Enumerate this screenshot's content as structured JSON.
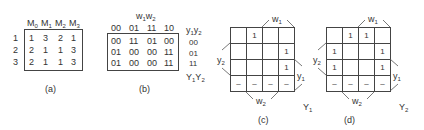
{
  "panel_a": {
    "caption": "(a)",
    "columns": [
      "M0",
      "M1",
      "M2",
      "M3"
    ],
    "rows": [
      {
        "label": "1",
        "values": [
          "1",
          "3",
          "2",
          "1"
        ]
      },
      {
        "label": "2",
        "values": [
          "2",
          "1",
          "1",
          "3"
        ]
      },
      {
        "label": "3",
        "values": [
          "2",
          "1",
          "1",
          "3"
        ]
      }
    ]
  },
  "panel_b": {
    "caption": "(b)",
    "input_label": "w1w2",
    "columns": [
      "00",
      "01",
      "11",
      "10"
    ],
    "state_label": "y1y2",
    "next_state_label": "Y1Y2",
    "rows": [
      {
        "state": "00",
        "values": [
          "00",
          "11",
          "01",
          "00"
        ]
      },
      {
        "state": "01",
        "values": [
          "01",
          "00",
          "00",
          "11"
        ]
      },
      {
        "state": "11",
        "values": [
          "01",
          "00",
          "00",
          "11"
        ]
      }
    ]
  },
  "panel_c": {
    "caption": "(c)",
    "function_label": "Y1",
    "labels": {
      "top": "w1",
      "left": "y2",
      "right": "y1",
      "bottom": "w2"
    },
    "grid": [
      [
        "",
        "1",
        "",
        ""
      ],
      [
        "",
        "",
        "",
        "1"
      ],
      [
        "",
        "",
        "",
        "1"
      ],
      [
        "–",
        "–",
        "–",
        "–"
      ]
    ]
  },
  "panel_d": {
    "caption": "(d)",
    "function_label": "Y2",
    "labels": {
      "top": "w1",
      "left": "y2",
      "right": "y1",
      "bottom": "w2"
    },
    "grid": [
      [
        "",
        "1",
        "1",
        ""
      ],
      [
        "1",
        "",
        "",
        "1"
      ],
      [
        "1",
        "",
        "",
        "1"
      ],
      [
        "–",
        "–",
        "–",
        "–"
      ]
    ]
  }
}
